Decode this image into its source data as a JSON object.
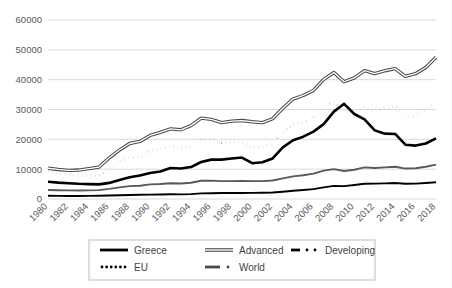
{
  "chart_data": {
    "type": "line",
    "title": "",
    "xlabel": "",
    "ylabel": "",
    "ylim": [
      0,
      60000
    ],
    "grid": true,
    "legend_position": "bottom",
    "y_ticks": [
      "0",
      "10000",
      "20000",
      "30000",
      "40000",
      "50000",
      "60000"
    ],
    "y_tick_values": [
      0,
      10000,
      20000,
      30000,
      40000,
      50000,
      60000
    ],
    "categories": [
      "1980",
      "1981",
      "1982",
      "1983",
      "1984",
      "1985",
      "1986",
      "1987",
      "1988",
      "1989",
      "1990",
      "1991",
      "1992",
      "1993",
      "1994",
      "1995",
      "1996",
      "1997",
      "1998",
      "1999",
      "2000",
      "2001",
      "2002",
      "2003",
      "2004",
      "2005",
      "2006",
      "2007",
      "2008",
      "2009",
      "2010",
      "2011",
      "2012",
      "2013",
      "2014",
      "2015",
      "2016",
      "2017",
      "2018"
    ],
    "x_tick_labels": [
      "1980",
      "1982",
      "1984",
      "1986",
      "1988",
      "1990",
      "1992",
      "1994",
      "1996",
      "1998",
      "2000",
      "2002",
      "2004",
      "2006",
      "2008",
      "2010",
      "2012",
      "2014",
      "2016",
      "2018"
    ],
    "series": [
      {
        "name": "Greece",
        "style": "solid-thick-black",
        "color": "#000000",
        "values": [
          5800,
          5500,
          5300,
          5100,
          5000,
          4900,
          5400,
          6400,
          7300,
          7900,
          8700,
          9200,
          10400,
          10200,
          10700,
          12400,
          13200,
          13200,
          13600,
          13900,
          12000,
          12300,
          13600,
          17300,
          19700,
          20900,
          22600,
          25100,
          29300,
          31900,
          28500,
          26700,
          23000,
          21900,
          21800,
          18200,
          17900,
          18600,
          20300
        ]
      },
      {
        "name": "Advanced",
        "style": "double-gray",
        "color": "#7f7f7f",
        "values": [
          10300,
          9900,
          9600,
          9700,
          10200,
          10700,
          13800,
          16400,
          18600,
          19300,
          21300,
          22300,
          23500,
          23200,
          24600,
          27100,
          26700,
          25600,
          26100,
          26300,
          25900,
          25600,
          26900,
          30400,
          33500,
          34700,
          36400,
          40100,
          42400,
          39300,
          40600,
          43000,
          42000,
          43000,
          43700,
          41100,
          42000,
          44100,
          47500
        ]
      },
      {
        "name": "Developing",
        "style": "dash-dot-black-thin",
        "color": "#000000",
        "values": [
          1100,
          1050,
          1030,
          1020,
          1040,
          1080,
          1150,
          1250,
          1350,
          1400,
          1480,
          1520,
          1580,
          1560,
          1620,
          1900,
          1950,
          2000,
          2000,
          2020,
          2050,
          2100,
          2200,
          2450,
          2750,
          3000,
          3300,
          3900,
          4400,
          4300,
          4700,
          5100,
          5150,
          5250,
          5350,
          5100,
          5150,
          5350,
          5600
        ]
      },
      {
        "name": "EU",
        "style": "dotted-black",
        "color": "#000000",
        "values": [
          9000,
          8600,
          8200,
          7900,
          7700,
          7900,
          10200,
          12300,
          13900,
          14100,
          16300,
          16600,
          17900,
          16800,
          17700,
          20000,
          20100,
          18900,
          19300,
          19000,
          17300,
          17400,
          18700,
          22400,
          25000,
          25800,
          27100,
          30700,
          32600,
          29700,
          29200,
          30700,
          29200,
          30500,
          31100,
          27200,
          28000,
          30200,
          32500
        ]
      },
      {
        "name": "World",
        "style": "dash-dot-gray",
        "color": "#595959",
        "values": [
          3000,
          2950,
          2900,
          2870,
          2900,
          2980,
          3400,
          3900,
          4300,
          4450,
          4900,
          5050,
          5300,
          5200,
          5450,
          6100,
          6150,
          6000,
          6000,
          6050,
          6000,
          6000,
          6200,
          6900,
          7600,
          7950,
          8500,
          9500,
          10000,
          9400,
          9800,
          10600,
          10400,
          10600,
          10800,
          10200,
          10300,
          10800,
          11500
        ]
      }
    ]
  },
  "legend": {
    "items": [
      {
        "label": "Greece",
        "swatch": "solid-thick-black"
      },
      {
        "label": "Advanced",
        "swatch": "double-gray"
      },
      {
        "label": "Developing",
        "swatch": "dash-dot-black"
      },
      {
        "label": "EU",
        "swatch": "dotted-black"
      },
      {
        "label": "World",
        "swatch": "dash-dot-gray"
      }
    ]
  },
  "colors": {
    "gridline": "#d0d0d0",
    "axis_text": "#595959",
    "legend_border": "#adadad",
    "background": "#ffffff"
  }
}
